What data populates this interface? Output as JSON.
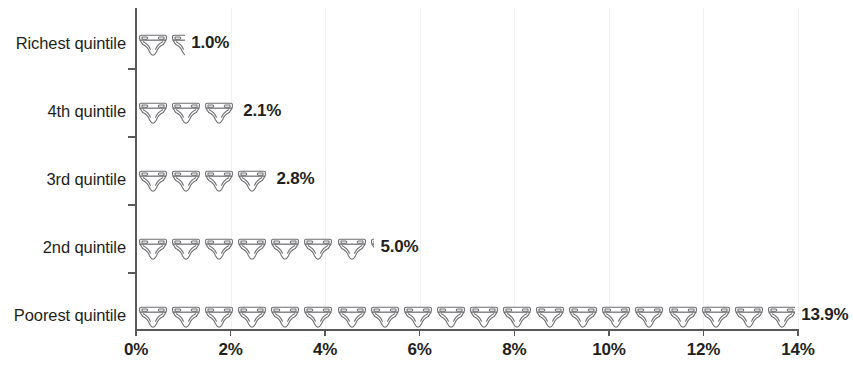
{
  "chart_data": {
    "type": "bar",
    "subtype": "pictogram",
    "title": "",
    "xlabel": "",
    "ylabel": "",
    "categories": [
      "Richest quintile",
      "4th quintile",
      "3rd quintile",
      "2nd quintile",
      "Poorest quintile"
    ],
    "values": [
      1.0,
      2.1,
      2.8,
      5.0,
      13.9
    ],
    "value_labels": [
      "1.0%",
      "2.1%",
      "2.8%",
      "5.0%",
      "13.9%"
    ],
    "xlim": [
      0,
      14
    ],
    "xticks": [
      0,
      2,
      4,
      6,
      8,
      10,
      12,
      14
    ],
    "xtick_labels": [
      "0%",
      "2%",
      "4%",
      "6%",
      "8%",
      "10%",
      "12%",
      "14%"
    ],
    "grid": true,
    "legend": "none",
    "icon_unit_value": 0.7,
    "icon_name": "diaper-icon",
    "icon_counts": [
      1.43,
      3.0,
      4.0,
      7.14,
      19.86
    ],
    "series": [
      {
        "name": "Share",
        "values": [
          1.0,
          2.1,
          2.8,
          5.0,
          13.9
        ]
      }
    ],
    "colors": {
      "axis": "#58595b",
      "text": "#231f20",
      "icon_stroke": "#6d6e71",
      "icon_fill": "#ffffff",
      "gridline": "#f1f1f1"
    }
  },
  "rows": [
    {
      "label": "Richest quintile",
      "value_label": "1.0%",
      "value": 1.0
    },
    {
      "label": "4th quintile",
      "value_label": "2.1%",
      "value": 2.1
    },
    {
      "label": "3rd quintile",
      "value_label": "2.8%",
      "value": 2.8
    },
    {
      "label": "2nd quintile",
      "value_label": "5.0%",
      "value": 5.0
    },
    {
      "label": "Poorest quintile",
      "value_label": "13.9%",
      "value": 13.9
    }
  ]
}
